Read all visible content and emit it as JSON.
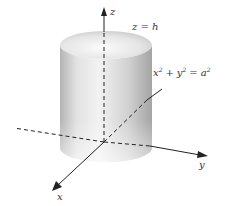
{
  "diagram": {
    "axes": {
      "x_label": "x",
      "y_label": "y",
      "z_label": "z"
    },
    "annotations": {
      "top_plane": "z = h",
      "surface_lhs_x": "x",
      "surface_lhs_y": "y",
      "surface_rhs": "a",
      "exponent": "2",
      "plus": "+",
      "equals": "="
    },
    "colors": {
      "axis": "#222222",
      "cylinder_light": "#f4f4f4",
      "cylinder_dark": "#a8a8a8",
      "top_face": "#e6e6e6"
    }
  }
}
